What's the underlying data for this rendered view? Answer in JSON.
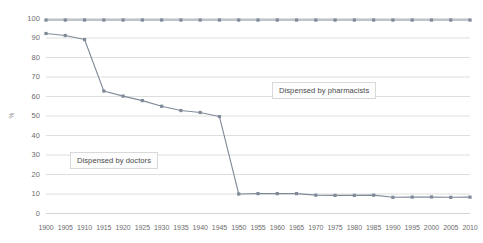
{
  "chart_data": {
    "type": "line",
    "title": "",
    "xlabel": "",
    "ylabel": "%",
    "ylim": [
      0,
      100
    ],
    "ytick_step": 10,
    "grid": true,
    "legend_position": "inline-annotations",
    "x": [
      1900,
      1905,
      1910,
      1915,
      1920,
      1925,
      1930,
      1935,
      1940,
      1945,
      1950,
      1955,
      1960,
      1965,
      1970,
      1975,
      1980,
      1985,
      1990,
      1995,
      2000,
      2005,
      2010
    ],
    "xtick_labels": [
      "1900",
      "1905",
      "1910",
      "1915",
      "1920",
      "1925",
      "1930",
      "1935",
      "1940",
      "1945",
      "1950",
      "1955",
      "1960",
      "1965",
      "1970",
      "1975",
      "1980",
      "1985",
      "1990",
      "1995",
      "2000",
      "2005",
      "2010"
    ],
    "ytick_labels": [
      "0",
      "10",
      "20",
      "30",
      "40",
      "50",
      "60",
      "70",
      "80",
      "90",
      "100"
    ],
    "series": [
      {
        "name": "Dispensed by pharmacists",
        "color": "#7f8a99",
        "values": [
          99.2,
          99.2,
          99.2,
          99.2,
          99.2,
          99.2,
          99.2,
          99.2,
          99.2,
          99.2,
          99.2,
          99.2,
          99.2,
          99.2,
          99.2,
          99.2,
          99.2,
          99.2,
          99.2,
          99.2,
          99.2,
          99.2,
          99.2
        ]
      },
      {
        "name": "Dispensed by doctors",
        "color": "#7f8a99",
        "values": [
          92.3,
          91.3,
          89.2,
          62.8,
          60.2,
          57.9,
          55.0,
          52.8,
          51.8,
          49.7,
          10.0,
          10.2,
          10.2,
          10.2,
          9.4,
          9.3,
          9.3,
          9.4,
          8.3,
          8.4,
          8.5,
          8.3,
          8.4
        ]
      }
    ],
    "annotations": [
      {
        "text": "Dispensed by pharmacists",
        "id": "label-pharmacists"
      },
      {
        "text": "Dispensed by doctors",
        "id": "label-doctors"
      }
    ]
  },
  "axis": {
    "y_title": "%"
  }
}
